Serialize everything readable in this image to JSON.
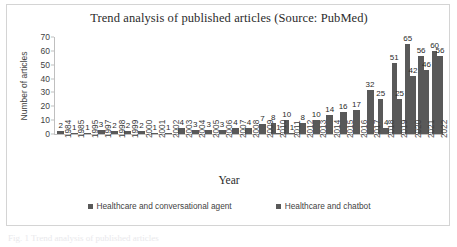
{
  "figure": {
    "caption": "Fig. 1  Trend analysis of published articles"
  },
  "chart_data": {
    "type": "bar",
    "title": "Trend analysis of published articles (Source: PubMed)",
    "xlabel": "Year",
    "ylabel": "Number of articles",
    "ylim": [
      0,
      70
    ],
    "yticks": [
      0,
      10,
      20,
      30,
      40,
      50,
      60,
      70
    ],
    "grid": false,
    "legend_position": "bottom",
    "bar_color": "#595959",
    "categories": [
      "1984",
      "1985",
      "1995",
      "1997",
      "1998",
      "1999",
      "2000",
      "2001",
      "2002",
      "2003",
      "2004",
      "2005",
      "2006",
      "2007",
      "2008",
      "2009",
      "2010",
      "2011",
      "2012",
      "2013",
      "2014",
      "2015",
      "2016",
      "2017",
      "2018",
      "2019",
      "2020",
      "2021",
      "2022"
    ],
    "series": [
      {
        "name": "Healthcare and conversational agent",
        "color": "#595959",
        "values": [
          2,
          1,
          1,
          3,
          2,
          2,
          2,
          1,
          1,
          4,
          3,
          3,
          3,
          4,
          4,
          7,
          8,
          10,
          8,
          10,
          14,
          16,
          17,
          32,
          25,
          51,
          65,
          56,
          60
        ]
      },
      {
        "name": "Healthcare and chatbot",
        "color": "#595959",
        "values": [
          0,
          0,
          0,
          0,
          0,
          0,
          0,
          0,
          0,
          0,
          0,
          0,
          0,
          0,
          0,
          0,
          1,
          1,
          0,
          0,
          0,
          0,
          0,
          0,
          4,
          25,
          42,
          46,
          56
        ]
      }
    ]
  },
  "legend": {
    "items": [
      {
        "label": "Healthcare and conversational agent",
        "swatch": "legend-swatch-icon"
      },
      {
        "label": "Healthcare and chatbot",
        "swatch": "legend-swatch-icon"
      }
    ]
  }
}
